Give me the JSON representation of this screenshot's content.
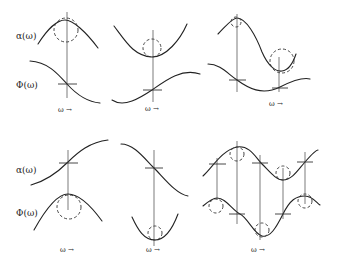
{
  "labels": {
    "alpha": "α(ω)",
    "phi": "Φ(ω)",
    "omega_axis": "ω →"
  },
  "panels": [
    {
      "id": "top-left",
      "alpha_shape": "maximum",
      "phi_shape": "decreasing-inflection",
      "circle_on": "alpha"
    },
    {
      "id": "top-middle",
      "alpha_shape": "minimum",
      "phi_shape": "increasing-inflection",
      "circle_on": "alpha"
    },
    {
      "id": "top-right",
      "alpha_shape": "maximum-then-minimum",
      "phi_shape": "oscillating",
      "circle_on": "alpha"
    },
    {
      "id": "bottom-left",
      "alpha_shape": "increasing-inflection",
      "phi_shape": "maximum",
      "circle_on": "phi"
    },
    {
      "id": "bottom-middle",
      "alpha_shape": "decreasing-inflection",
      "phi_shape": "minimum",
      "circle_on": "phi"
    },
    {
      "id": "bottom-right",
      "alpha_shape": "sinusoid",
      "phi_shape": "sinusoid-shifted",
      "circle_on": "both"
    }
  ]
}
